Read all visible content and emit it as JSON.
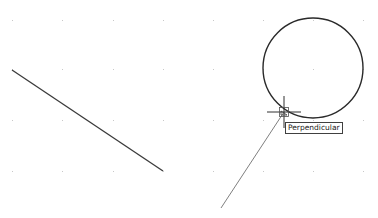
{
  "drawing": {
    "background": "#ffffff",
    "grid": {
      "color": "#c8c8c8",
      "xs": [
        12,
        62,
        113,
        163,
        213,
        263,
        313,
        363
      ],
      "ys": [
        20,
        69,
        120,
        171
      ]
    },
    "line": {
      "x1": 12,
      "y1": 70,
      "x2": 163,
      "y2": 171,
      "color": "#3a3a3a"
    },
    "circle": {
      "cx": 313,
      "cy": 68,
      "r": 50,
      "color": "#2a2a2a"
    },
    "rubber_band": {
      "x1": 221,
      "y1": 208,
      "x2": 284,
      "y2": 112,
      "color": "#707070"
    },
    "cursor": {
      "x": 284,
      "y": 112,
      "arm": 17,
      "box": 9
    }
  },
  "snap": {
    "tooltip": "Perpendicular"
  }
}
